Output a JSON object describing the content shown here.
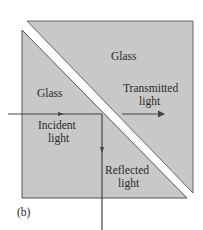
{
  "diagram": {
    "panel_label": "(b)",
    "regions": {
      "upper_glass": "Glass",
      "lower_glass": "Glass"
    },
    "rays": {
      "incident": [
        "Incident",
        "light"
      ],
      "transmitted": [
        "Transmitted",
        "light"
      ],
      "reflected": [
        "Reflected",
        "light"
      ]
    },
    "colors": {
      "glass_fill": "#c8c8c8",
      "edge": "#555555",
      "ray": "#444444",
      "gap": "#ffffff"
    }
  }
}
